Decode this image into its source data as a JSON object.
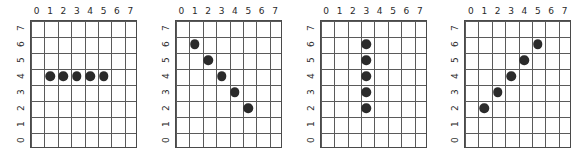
{
  "figure": {
    "background_color": "#ffffff",
    "grid_line_color": "#5a5a5a",
    "marker_color": "#2b2b2b",
    "panel_count": 4
  },
  "chart_data": [
    {
      "type": "scatter",
      "title": "",
      "xlabel": "",
      "ylabel": "",
      "xlim": [
        0,
        8
      ],
      "ylim": [
        0,
        8
      ],
      "xticks": [
        "0",
        "1",
        "2",
        "3",
        "4",
        "5",
        "6",
        "7"
      ],
      "yticks": [
        "7",
        "6",
        "5",
        "4",
        "3",
        "2",
        "1",
        "0"
      ],
      "grid": true,
      "legend": "none",
      "pattern": "horizontal-line",
      "points": [
        {
          "x": 1,
          "y": 4
        },
        {
          "x": 2,
          "y": 4
        },
        {
          "x": 3,
          "y": 4
        },
        {
          "x": 4,
          "y": 4
        },
        {
          "x": 5,
          "y": 4
        }
      ]
    },
    {
      "type": "scatter",
      "title": "",
      "xlabel": "",
      "ylabel": "",
      "xlim": [
        0,
        8
      ],
      "ylim": [
        0,
        8
      ],
      "xticks": [
        "0",
        "1",
        "2",
        "3",
        "4",
        "5",
        "6",
        "7"
      ],
      "yticks": [
        "7",
        "6",
        "5",
        "4",
        "3",
        "2",
        "1",
        "0"
      ],
      "grid": true,
      "legend": "none",
      "pattern": "descending-diagonal",
      "points": [
        {
          "x": 1,
          "y": 6
        },
        {
          "x": 2,
          "y": 5
        },
        {
          "x": 3,
          "y": 4
        },
        {
          "x": 4,
          "y": 3
        },
        {
          "x": 5,
          "y": 2
        }
      ]
    },
    {
      "type": "scatter",
      "title": "",
      "xlabel": "",
      "ylabel": "",
      "xlim": [
        0,
        8
      ],
      "ylim": [
        0,
        8
      ],
      "xticks": [
        "0",
        "1",
        "2",
        "3",
        "4",
        "5",
        "6",
        "7"
      ],
      "yticks": [
        "7",
        "6",
        "5",
        "4",
        "3",
        "2",
        "1",
        "0"
      ],
      "grid": true,
      "legend": "none",
      "pattern": "vertical-line",
      "points": [
        {
          "x": 3,
          "y": 6
        },
        {
          "x": 3,
          "y": 5
        },
        {
          "x": 3,
          "y": 4
        },
        {
          "x": 3,
          "y": 3
        },
        {
          "x": 3,
          "y": 2
        }
      ]
    },
    {
      "type": "scatter",
      "title": "",
      "xlabel": "",
      "ylabel": "",
      "xlim": [
        0,
        8
      ],
      "ylim": [
        0,
        8
      ],
      "xticks": [
        "0",
        "1",
        "2",
        "3",
        "4",
        "5",
        "6",
        "7"
      ],
      "yticks": [
        "7",
        "6",
        "5",
        "4",
        "3",
        "2",
        "1",
        "0"
      ],
      "grid": true,
      "legend": "none",
      "pattern": "ascending-diagonal",
      "points": [
        {
          "x": 1,
          "y": 2
        },
        {
          "x": 2,
          "y": 3
        },
        {
          "x": 3,
          "y": 4
        },
        {
          "x": 4,
          "y": 5
        },
        {
          "x": 5,
          "y": 6
        }
      ]
    }
  ]
}
